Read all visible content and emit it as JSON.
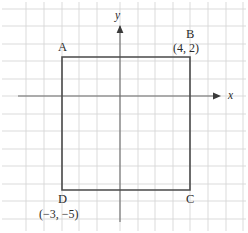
{
  "figure": {
    "background_color": "#ffffff",
    "width": 248,
    "height": 233
  },
  "axes": {
    "x_label": "x",
    "y_label": "y",
    "axis_color": "#6b6b6b",
    "arrow_color": "#3a3a3a",
    "x_axis_y_pixel": 96,
    "y_axis_x_pixel": 120,
    "unit_pixels": 17.5,
    "x_range": [
      -7,
      7
    ],
    "y_range": [
      -7,
      7
    ],
    "ticks_shown": false,
    "tick_labels": []
  },
  "grid": {
    "visible": true,
    "color": "#d7d7d7",
    "spacing_pixels": 17.5,
    "vertical_lines": [
      26,
      44,
      62,
      79,
      97,
      120,
      138,
      155,
      173,
      190,
      208,
      226,
      243
    ],
    "horizontal_lines": [
      9,
      26,
      44,
      61,
      79,
      96,
      114,
      131,
      149,
      166,
      184,
      201,
      219
    ]
  },
  "shape": {
    "name": "rectangle-abcd",
    "type": "rectangle",
    "stroke_color": "#4a4a4a",
    "stroke_width": 1.6,
    "fill": "none",
    "vertices": [
      {
        "id": "A",
        "label": "A",
        "coord_text": "",
        "x": -3,
        "y": 2,
        "px": 62,
        "py": 57
      },
      {
        "id": "B",
        "label": "B",
        "coord_text": "(4, 2)",
        "x": 4,
        "y": 2,
        "px": 190,
        "py": 57
      },
      {
        "id": "C",
        "label": "C",
        "coord_text": "",
        "x": 4,
        "y": -5,
        "px": 190,
        "py": 190
      },
      {
        "id": "D",
        "label": "D",
        "coord_text": "(−3, −5)",
        "x": -3,
        "y": -5,
        "px": 62,
        "py": 190
      }
    ]
  },
  "labels": {
    "a_letter": "A",
    "b_letter": "B",
    "b_coord": "(4, 2)",
    "c_letter": "C",
    "d_letter": "D",
    "d_coord": "(−3, −5)",
    "x_axis": "x",
    "y_axis": "y"
  }
}
